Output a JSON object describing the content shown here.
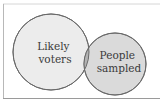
{
  "diagram": {
    "type": "venn",
    "sets": [
      {
        "id": "likely-voters",
        "label_lines": [
          "Likely",
          "voters"
        ],
        "fill": "#ececec",
        "stroke": "#6a6a6a"
      },
      {
        "id": "people-sampled",
        "label_lines": [
          "People",
          "sampled"
        ],
        "fill": "#dadada",
        "stroke": "#6a6a6a"
      }
    ],
    "intersection": {
      "fill": "#b3b3b3"
    },
    "frame_color": "#b8b8b8"
  }
}
